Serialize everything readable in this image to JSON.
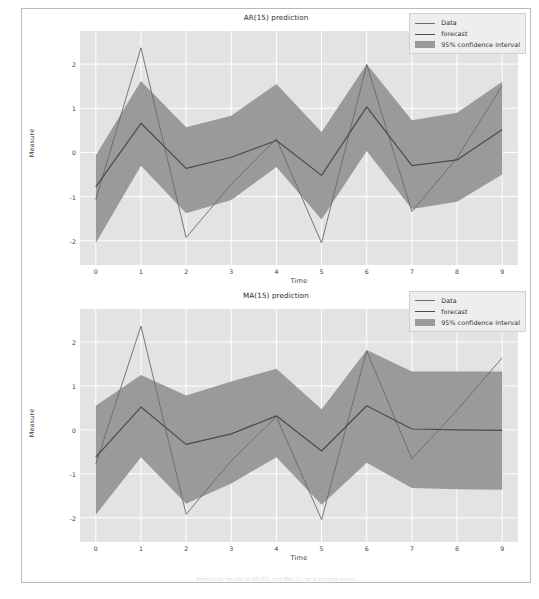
{
  "figure": {
    "caption": "Prediction results of AR(15) and MA(15) on a sample series",
    "background": "#ffffff",
    "axes_background": "#e3e3e3",
    "grid_color": "#ffffff",
    "band_color": "#9a9a9a",
    "data_line_color": "#6a6a6a",
    "forecast_line_color": "#4b4b4b"
  },
  "legend": {
    "items": [
      {
        "label": "Data",
        "key": "line-thin"
      },
      {
        "label": "forecast",
        "key": "line-thick"
      },
      {
        "label": "95% confidence interval",
        "key": "patch"
      }
    ]
  },
  "chart_data": [
    {
      "type": "line",
      "id": "ar15",
      "title": "AR(15) prediction",
      "xlabel": "Time",
      "ylabel": "Measure",
      "grid": true,
      "legend_position": "upper right",
      "x": [
        0,
        1,
        2,
        3,
        4,
        5,
        6,
        7,
        8,
        9
      ],
      "xlim": [
        -0.35,
        9.35
      ],
      "ylim": [
        -2.55,
        2.75
      ],
      "xticks": [
        0,
        1,
        2,
        3,
        4,
        5,
        6,
        7,
        8,
        9
      ],
      "xticklabels": [
        "0",
        "1",
        "2",
        "3",
        "4",
        "5",
        "6",
        "7",
        "8",
        "9"
      ],
      "yticks": [
        -2,
        -1,
        0,
        1,
        2
      ],
      "yticklabels": [
        "-2",
        "-1",
        "0",
        "1",
        "2"
      ],
      "series": [
        {
          "name": "Data",
          "values": [
            -1.07,
            2.37,
            -1.93,
            -0.72,
            0.31,
            -2.05,
            1.99,
            -1.34,
            -0.12,
            1.51
          ]
        },
        {
          "name": "forecast",
          "values": [
            -0.78,
            0.66,
            -0.36,
            -0.11,
            0.27,
            -0.52,
            1.03,
            -0.3,
            -0.17,
            0.52
          ]
        }
      ],
      "confidence_interval": {
        "name": "95% confidence interval",
        "lower": [
          -2.05,
          -0.3,
          -1.38,
          -1.08,
          -0.33,
          -1.52,
          0.03,
          -1.28,
          -1.12,
          -0.5
        ],
        "upper": [
          -0.07,
          1.62,
          0.57,
          0.83,
          1.55,
          0.46,
          2.0,
          0.73,
          0.9,
          1.6
        ]
      }
    },
    {
      "type": "line",
      "id": "ma15",
      "title": "MA(15) prediction",
      "xlabel": "Time",
      "ylabel": "Measure",
      "grid": true,
      "legend_position": "upper right",
      "x": [
        0,
        1,
        2,
        3,
        4,
        5,
        6,
        7,
        8,
        9
      ],
      "xlim": [
        -0.35,
        9.35
      ],
      "ylim": [
        -2.55,
        2.75
      ],
      "xticks": [
        0,
        1,
        2,
        3,
        4,
        5,
        6,
        7,
        8,
        9
      ],
      "xticklabels": [
        "0",
        "1",
        "2",
        "3",
        "4",
        "5",
        "6",
        "7",
        "8",
        "9"
      ],
      "yticks": [
        -2,
        -1,
        0,
        1,
        2
      ],
      "yticklabels": [
        "-2",
        "-1",
        "0",
        "1",
        "2"
      ],
      "series": [
        {
          "name": "Data",
          "values": [
            -0.78,
            2.36,
            -1.92,
            -0.7,
            0.3,
            -2.04,
            1.8,
            -0.66,
            0.45,
            1.64
          ]
        },
        {
          "name": "forecast",
          "values": [
            -0.62,
            0.52,
            -0.33,
            -0.09,
            0.32,
            -0.48,
            0.55,
            0.02,
            0.0,
            -0.01
          ]
        }
      ],
      "confidence_interval": {
        "name": "95% confidence interval",
        "lower": [
          -1.93,
          -0.62,
          -1.68,
          -1.22,
          -0.62,
          -1.7,
          -0.75,
          -1.32,
          -1.35,
          -1.36
        ],
        "upper": [
          0.55,
          1.25,
          0.78,
          1.1,
          1.39,
          0.47,
          1.82,
          1.33,
          1.33,
          1.33
        ]
      }
    }
  ]
}
